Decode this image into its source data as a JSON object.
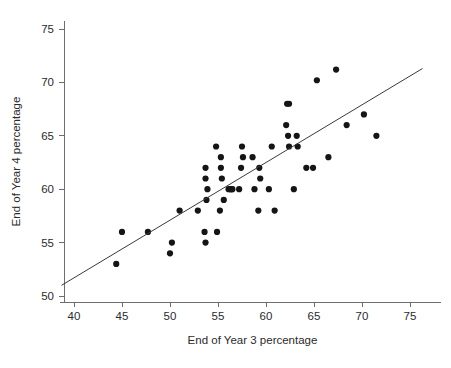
{
  "chart_data": {
    "type": "scatter",
    "title": "",
    "xlabel": "End of Year 3 percentage",
    "ylabel": "End of Year 4 percentage",
    "xlim": [
      38.5,
      76.5
    ],
    "ylim": [
      48.5,
      76.5
    ],
    "xticks": [
      40,
      45,
      50,
      55,
      60,
      65,
      70,
      75
    ],
    "yticks": [
      50,
      55,
      60,
      65,
      70,
      75
    ],
    "grid": false,
    "legend": null,
    "marker": "filled-circle",
    "marker_color": "#151515",
    "points": [
      [
        44.4,
        53.0
      ],
      [
        45.0,
        56.0
      ],
      [
        47.7,
        56.0
      ],
      [
        50.0,
        54.0
      ],
      [
        50.2,
        55.0
      ],
      [
        51.0,
        58.0
      ],
      [
        52.9,
        58.0
      ],
      [
        53.6,
        56.0
      ],
      [
        53.7,
        55.0
      ],
      [
        53.7,
        62.0
      ],
      [
        53.7,
        61.0
      ],
      [
        53.8,
        59.0
      ],
      [
        53.9,
        60.0
      ],
      [
        54.8,
        64.0
      ],
      [
        54.9,
        56.0
      ],
      [
        55.2,
        58.0
      ],
      [
        55.3,
        63.0
      ],
      [
        55.3,
        62.0
      ],
      [
        55.4,
        61.0
      ],
      [
        55.6,
        59.0
      ],
      [
        56.1,
        60.0
      ],
      [
        56.3,
        60.0
      ],
      [
        56.4,
        60.0
      ],
      [
        56.5,
        60.0
      ],
      [
        57.2,
        60.0
      ],
      [
        57.4,
        62.0
      ],
      [
        57.5,
        64.0
      ],
      [
        57.6,
        63.0
      ],
      [
        58.6,
        63.0
      ],
      [
        58.8,
        60.0
      ],
      [
        59.2,
        58.0
      ],
      [
        59.3,
        62.0
      ],
      [
        59.4,
        61.0
      ],
      [
        60.3,
        60.0
      ],
      [
        60.6,
        64.0
      ],
      [
        60.9,
        58.0
      ],
      [
        62.1,
        66.0
      ],
      [
        62.2,
        68.0
      ],
      [
        62.4,
        68.0
      ],
      [
        62.3,
        65.0
      ],
      [
        62.4,
        64.0
      ],
      [
        62.9,
        60.0
      ],
      [
        63.2,
        65.0
      ],
      [
        63.3,
        64.0
      ],
      [
        64.2,
        62.0
      ],
      [
        64.9,
        62.0
      ],
      [
        65.3,
        70.2
      ],
      [
        66.5,
        63.0
      ],
      [
        67.3,
        71.2
      ],
      [
        68.4,
        66.0
      ],
      [
        70.2,
        67.0
      ],
      [
        71.5,
        65.0
      ]
    ],
    "fit_line": {
      "label": "regression line",
      "x0": 38.7,
      "y0": 51.0,
      "x1": 76.3,
      "y1": 71.3,
      "color": "#3a3a3a"
    }
  },
  "axes": {
    "x_title": "End of Year 3 percentage",
    "y_title": "End of Year 4 percentage",
    "x_tick_labels": [
      "40",
      "45",
      "50",
      "55",
      "60",
      "65",
      "70",
      "75"
    ],
    "y_tick_labels": [
      "50",
      "55",
      "60",
      "65",
      "70",
      "75"
    ]
  },
  "colors": {
    "background": "#ffffff",
    "axis": "#6e6e6e",
    "text": "#2b2b2b",
    "marker": "#151515",
    "line": "#3a3a3a"
  }
}
